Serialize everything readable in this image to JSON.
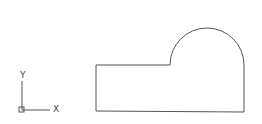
{
  "ucs_icon": {
    "x_label": "X",
    "y_label": "Y"
  },
  "colors": {
    "stroke": "#555555",
    "background": "#ffffff"
  },
  "shape": {
    "description": "rectangle with semicircular bump on upper right",
    "path": "M96,65 L170,65 A37,37 0 0 1 244,65 L244,112 L96,111 Z"
  }
}
